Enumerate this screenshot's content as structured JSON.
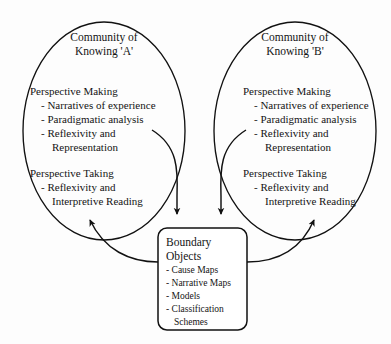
{
  "figure": {
    "type": "process-diagram",
    "background_color": "#fdfdfd",
    "stroke_color": "#111111"
  },
  "communities": [
    {
      "id": "community-a",
      "title_line1": "Community of",
      "title_line2": "Knowing 'A'",
      "making": {
        "heading": "Perspective Making",
        "items": [
          "- Narratives of experience",
          "- Paradigmatic analysis",
          "- Reflexivity and",
          "Representation"
        ]
      },
      "taking": {
        "heading": "Perspective Taking",
        "items": [
          "- Reflexivity and",
          "Interpretive Reading"
        ]
      }
    },
    {
      "id": "community-b",
      "title_line1": "Community of",
      "title_line2": "Knowing 'B'",
      "making": {
        "heading": "Perspective Making",
        "items": [
          "- Narratives of experience",
          "- Paradigmatic analysis",
          "- Reflexivity and",
          "Representation"
        ]
      },
      "taking": {
        "heading": "Perspective Taking",
        "items": [
          "- Reflexivity and",
          "Interpretive Reading"
        ]
      }
    }
  ],
  "boundary_objects": {
    "title_line1": "Boundary",
    "title_line2": "Objects",
    "items": [
      "- Cause Maps",
      "- Narrative Maps",
      "- Models",
      "- Classification",
      "Schemes"
    ]
  },
  "connectors": [
    {
      "name": "a-representation-to-boundary-objects",
      "direction": "into-boundary-objects",
      "arrowhead": "down"
    },
    {
      "name": "b-representation-to-boundary-objects",
      "direction": "into-boundary-objects",
      "arrowhead": "down"
    },
    {
      "name": "boundary-objects-to-a-perspective-taking",
      "direction": "out-of-boundary-objects",
      "arrowhead": "up"
    },
    {
      "name": "boundary-objects-to-b-perspective-taking",
      "direction": "out-of-boundary-objects",
      "arrowhead": "up"
    }
  ]
}
